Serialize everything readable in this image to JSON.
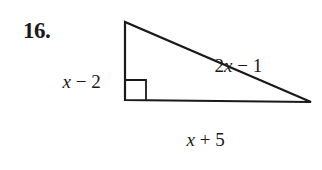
{
  "problem": {
    "number": "16."
  },
  "triangle": {
    "type": "right-triangle",
    "right_angle_vertex": "bottom-left",
    "vertices": {
      "top": [
        125,
        22
      ],
      "bottom_left": [
        125,
        100
      ],
      "bottom_right": [
        311,
        102
      ]
    },
    "right_angle_marker_size": 21,
    "stroke_color": "#1a1a1a",
    "sides": {
      "vertical_leg": {
        "var": "x",
        "op": " − ",
        "const": "2"
      },
      "hypotenuse": {
        "coef": "2",
        "var": "x",
        "op": " − ",
        "const": "1"
      },
      "base_leg": {
        "var": "x",
        "op": " + ",
        "const": "5"
      }
    }
  }
}
